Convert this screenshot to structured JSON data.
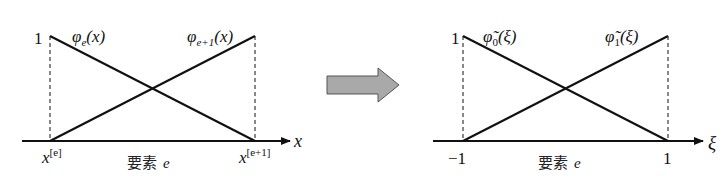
{
  "left_diagram": {
    "y_tick_one": "1",
    "curve_left_label": "φ",
    "curve_left_sub": "e",
    "curve_left_arg": "(x)",
    "curve_right_label": "φ",
    "curve_right_sub": "e+1",
    "curve_right_arg": "(x)",
    "axis_label": "x",
    "node_left_base": "x",
    "node_left_sup": "[e]",
    "node_right_base": "x",
    "node_right_sup": "[e+1]",
    "element_label": "要素",
    "element_var": "e"
  },
  "transform_arrow": {
    "icon": "right-arrow-icon",
    "fill": "#a9a9a9",
    "stroke": "#555555"
  },
  "right_diagram": {
    "y_tick_one": "1",
    "curve_left_label": "φ̃",
    "curve_left_sub": "0",
    "curve_left_arg": "(ξ)",
    "curve_right_label": "φ̃",
    "curve_right_sub": "1",
    "curve_right_arg": "(ξ)",
    "axis_label": "ξ",
    "node_left": "−1",
    "node_right": "1",
    "element_label": "要素",
    "element_var": "e"
  }
}
